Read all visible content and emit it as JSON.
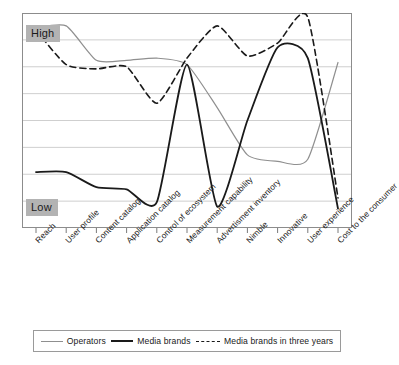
{
  "axis": {
    "high_label": "High",
    "low_label": "Low"
  },
  "legend": {
    "items": [
      {
        "label": "Operators",
        "key": "operators",
        "style": "solid-thin-gray",
        "color": "#8f8f8f"
      },
      {
        "label": "Media brands",
        "key": "media_brands",
        "style": "solid-thick-dark",
        "color": "#1a1a1a"
      },
      {
        "label": "Media brands in three years",
        "key": "media_brands_three_years",
        "style": "dashed-dark",
        "color": "#1a1a1a"
      }
    ]
  },
  "chart_data": {
    "type": "line",
    "title": "",
    "xlabel": "",
    "ylabel": "",
    "grid": true,
    "gridlines": 7,
    "legend_position": "bottom",
    "ylim": [
      0,
      10
    ],
    "ytick_labels": [
      "Low",
      "High"
    ],
    "categories": [
      "Reach",
      "User profile",
      "Content catalog",
      "Application catalog",
      "Control of ecosystem",
      "Measurement capability",
      "Advertisment inventory",
      "Nimble",
      "Innovative",
      "User experience",
      "Cost to the consumer"
    ],
    "series": [
      {
        "name": "Operators",
        "color": "#8f8f8f",
        "style": "solid",
        "width": 1.2,
        "values": [
          9.3,
          9.4,
          7.8,
          7.8,
          7.9,
          7.6,
          5.6,
          3.4,
          3.1,
          3.2,
          7.7
        ]
      },
      {
        "name": "Media brands",
        "color": "#1a1a1a",
        "style": "solid",
        "width": 1.8,
        "values": [
          2.6,
          2.6,
          1.9,
          1.8,
          1.2,
          7.6,
          1.0,
          5.0,
          8.4,
          7.9,
          0.9
        ]
      },
      {
        "name": "Media brands in three years",
        "color": "#1a1a1a",
        "style": "dashed",
        "width": 1.6,
        "values": [
          9.2,
          7.6,
          7.4,
          7.5,
          5.8,
          7.9,
          9.4,
          8.0,
          8.6,
          9.8,
          1.4
        ]
      }
    ]
  }
}
